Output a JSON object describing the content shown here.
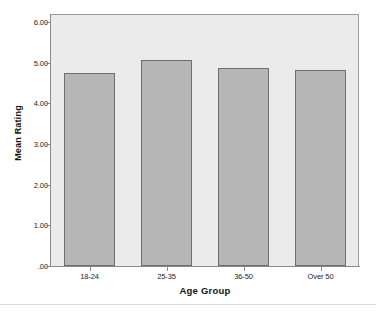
{
  "chart_data": {
    "type": "bar",
    "title": "",
    "subtitle": "",
    "xlabel": "Age Group",
    "ylabel": "Mean Rating",
    "categories": [
      "18-24",
      "25-35",
      "36-50",
      "Over 50"
    ],
    "values": [
      4.75,
      5.08,
      4.88,
      4.82
    ],
    "series": [
      {
        "name": "Mean Rating",
        "values": [
          4.75,
          5.08,
          4.88,
          4.82
        ]
      }
    ],
    "ylim": [
      0,
      6.2
    ],
    "ytick_values": [
      6.0,
      5.0,
      4.0,
      3.0,
      2.0,
      1.0,
      0.0
    ],
    "ytick_labels": [
      "6.00",
      "5.00",
      "4.00",
      "3.00",
      "2.00",
      "1.00",
      ".00"
    ],
    "grid": false,
    "legend": null,
    "legend_position": "none",
    "annotations": [],
    "colors": {
      "bar_fill": "#b6b6b6",
      "bar_border": "#6e6e6e",
      "plot_background": "#ebebeb",
      "page_background": "#ffffff",
      "axis_line": "#8a8a8a",
      "text": "#1c1c1c"
    }
  }
}
